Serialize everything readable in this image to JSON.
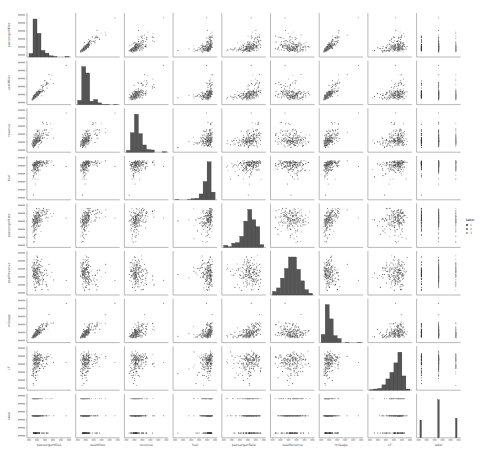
{
  "chart_data": {
    "type": "scatter",
    "title": "",
    "subtype": "pairplot",
    "variables": [
      "passengerMiles",
      "seatMiles",
      "revenue",
      "fuel",
      "passengerRate",
      "seatRevenue",
      "mileage",
      "LF",
      "label"
    ],
    "hue": "label",
    "legend": {
      "title": "label",
      "entries": [
        "1",
        "2",
        "3"
      ],
      "position": "right"
    },
    "diag": "hist",
    "grid": false,
    "n_points": 200,
    "correlations": [
      [
        1.0,
        0.95,
        0.7,
        0.45,
        0.55,
        -0.1,
        0.9,
        0.3,
        -0.5
      ],
      [
        0.95,
        1.0,
        0.65,
        0.4,
        0.4,
        -0.1,
        0.95,
        0.1,
        -0.5
      ],
      [
        0.7,
        0.65,
        1.0,
        0.4,
        0.5,
        0.0,
        0.6,
        0.2,
        -0.4
      ],
      [
        0.45,
        0.4,
        0.4,
        1.0,
        0.6,
        0.0,
        0.4,
        0.5,
        -0.2
      ],
      [
        0.55,
        0.4,
        0.5,
        0.6,
        1.0,
        -0.1,
        0.4,
        0.9,
        0.0
      ],
      [
        -0.1,
        -0.1,
        0.0,
        0.0,
        -0.1,
        1.0,
        -0.3,
        0.0,
        0.0
      ],
      [
        0.9,
        0.95,
        0.6,
        0.4,
        0.4,
        -0.3,
        1.0,
        0.1,
        -0.4
      ],
      [
        0.3,
        0.1,
        0.2,
        0.5,
        0.9,
        0.0,
        0.1,
        1.0,
        0.0
      ],
      [
        -0.5,
        -0.5,
        -0.4,
        -0.2,
        0.0,
        0.0,
        -0.4,
        0.0,
        1.0
      ]
    ],
    "skew": [
      1,
      1,
      1,
      -2,
      -1,
      0,
      1,
      -1,
      0
    ],
    "label_counts": {
      "1": 0.25,
      "2": 0.5,
      "3": 0.25
    },
    "point_color": "#4c4c4c",
    "bar_color": "#555555",
    "axis_color": "#888888"
  }
}
